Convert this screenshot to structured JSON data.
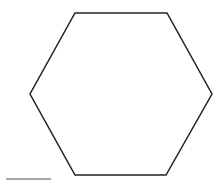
{
  "diagram": {
    "shape": "hexagon",
    "stroke_color": "#222222",
    "fill_color": "#ffffff",
    "legend_line_color": "#888888"
  }
}
